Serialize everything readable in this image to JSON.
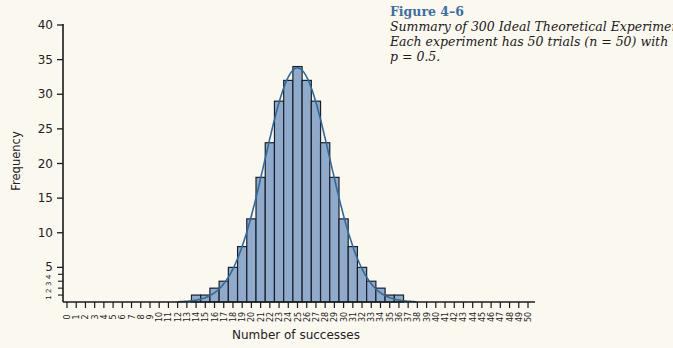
{
  "caption": {
    "label": "Figure 4–6",
    "line1": "Summary of 300 Ideal Theoretical Experiments",
    "line2": "Each experiment has 50 trials (n = 50) with",
    "line3": "p = 0.5."
  },
  "colors": {
    "background": "#fbf8ef",
    "bar_fill": "#8faacb",
    "bar_stroke": "#1a1f28",
    "curve": "#2f6a9a",
    "axis": "#1a1a1a",
    "caption_label": "#3a6fa6"
  },
  "chart_data": {
    "type": "bar",
    "subtitle": "Each experiment has 50 trials (n = 50) with p = 0.5.",
    "xlabel": "Number of successes",
    "ylabel": "Frequency",
    "xlim": [
      0,
      50
    ],
    "ylim": [
      0,
      40
    ],
    "x_ticks": [
      0,
      1,
      2,
      3,
      4,
      5,
      6,
      7,
      8,
      9,
      10,
      11,
      12,
      13,
      14,
      15,
      16,
      17,
      18,
      19,
      20,
      21,
      22,
      23,
      24,
      25,
      26,
      27,
      28,
      29,
      30,
      31,
      32,
      33,
      34,
      35,
      36,
      37,
      38,
      39,
      40,
      41,
      42,
      43,
      44,
      45,
      46,
      47,
      48,
      49,
      50
    ],
    "y_ticks_major": [
      5,
      10,
      15,
      20,
      25,
      30,
      35,
      40
    ],
    "y_ticks_minor": [
      1,
      2,
      3,
      4
    ],
    "categories": [
      14,
      15,
      16,
      17,
      18,
      19,
      20,
      21,
      22,
      23,
      24,
      25,
      26,
      27,
      28,
      29,
      30,
      31,
      32,
      33,
      34,
      35,
      36
    ],
    "values": [
      1,
      1,
      2,
      3,
      5,
      8,
      12,
      18,
      23,
      29,
      32,
      34,
      32,
      29,
      23,
      18,
      12,
      8,
      5,
      3,
      2,
      1,
      1
    ],
    "overlay": {
      "type": "line",
      "name": "Normal curve approximation",
      "mean": 25,
      "sd": 3.54,
      "scale": 300
    },
    "grid": false,
    "legend": null
  }
}
